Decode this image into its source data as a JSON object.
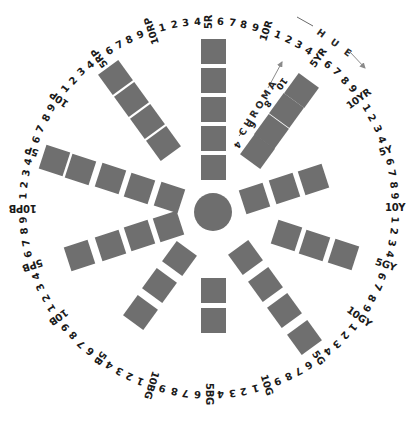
{
  "diagram": {
    "center": {
      "x": 213,
      "y": 212,
      "radius": 19
    },
    "ring": {
      "cx": 209,
      "cy": 208,
      "r": 186
    },
    "colors": {
      "swatch": "#6f6f6f",
      "center_disc": "#6e6e6e",
      "text": "#1a1a1a",
      "arrow": "#8a8a8a"
    },
    "hue_labels": [
      "5R",
      "6",
      "7",
      "8",
      "9",
      "10R",
      "1",
      "2",
      "3",
      "4",
      "5YR",
      "6",
      "7",
      "8",
      "9",
      "10YR",
      "1",
      "2",
      "3",
      "4",
      "5Y",
      "6",
      "7",
      "8",
      "9",
      "10Y",
      "1",
      "2",
      "3",
      "4",
      "5GY",
      "6",
      "7",
      "8",
      "9",
      "10GY",
      "1",
      "2",
      "3",
      "4",
      "5G",
      "6",
      "7",
      "8",
      "9",
      "10G",
      "1",
      "2",
      "3",
      "4",
      "5BG",
      "6",
      "7",
      "8",
      "9",
      "10BG",
      "1",
      "2",
      "3",
      "4",
      "5B",
      "6",
      "7",
      "8",
      "9",
      "10B",
      "1",
      "2",
      "3",
      "4",
      "5PB",
      "6",
      "7",
      "8",
      "9",
      "10PB",
      "1",
      "2",
      "3",
      "4",
      "5P",
      "6",
      "7",
      "8",
      "9",
      "10P",
      "1",
      "2",
      "3",
      "4",
      "5RP",
      "6",
      "7",
      "8",
      "9",
      "10RP",
      "1",
      "2",
      "3",
      "4"
    ],
    "spokes": [
      {
        "hue": "5R",
        "angle": 0,
        "distances": [
          45,
          74,
          103,
          132,
          161
        ]
      },
      {
        "hue": "5YR",
        "angle": 36,
        "distances": [
          75,
          100,
          125,
          150
        ]
      },
      {
        "hue": "5Y",
        "angle": 72,
        "distances": [
          44,
          75,
          106
        ]
      },
      {
        "hue": "5GY",
        "angle": 108,
        "distances": [
          77,
          107,
          137
        ]
      },
      {
        "hue": "5G",
        "angle": 144,
        "distances": [
          56,
          89,
          122,
          155
        ]
      },
      {
        "hue": "5BG",
        "angle": 180,
        "distances": [
          78,
          108
        ]
      },
      {
        "hue": "5B",
        "angle": 216,
        "distances": [
          57,
          91,
          124
        ]
      },
      {
        "hue": "5PB",
        "angle": 252,
        "distances": [
          47,
          77,
          108,
          140
        ]
      },
      {
        "hue": "5P",
        "angle": 288,
        "distances": [
          46,
          77,
          108,
          139,
          167
        ]
      },
      {
        "hue": "5RP",
        "angle": 324,
        "distances": [
          85,
          112,
          139,
          166
        ]
      }
    ],
    "chroma_axis": {
      "title": "CHROMA",
      "values": [
        "4",
        "6",
        "8",
        "10"
      ]
    },
    "hue_axis": {
      "title": "HUE"
    }
  }
}
